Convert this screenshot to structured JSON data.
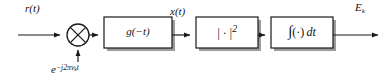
{
  "diagram": {
    "background_color": "#ffffff",
    "line_color": "#1a1a1a",
    "shadow_color": "#9a9a9a",
    "signals": {
      "input_label": "r(t)",
      "local_oscillator_label_base": "e",
      "local_oscillator_exponent": "−j2πν",
      "local_oscillator_exponent_subscript": "k",
      "local_oscillator_exponent_tail": "t",
      "intermediate_label": "x(t)",
      "output_label_base": "E",
      "output_label_subscript": "k"
    },
    "nodes": [
      {
        "name": "multiplier",
        "symbol": "⊗",
        "shape": "circle-with-cross",
        "cx": 78,
        "cy": 35,
        "r": 11
      }
    ],
    "blocks": [
      {
        "name": "matched-filter",
        "label": "g(−t)",
        "x": 104,
        "y": 17,
        "width": 68,
        "height": 31
      },
      {
        "name": "magnitude-squared",
        "label_base": "| · |",
        "label_exponent": "2",
        "x": 196,
        "y": 17,
        "width": 62,
        "height": 31
      },
      {
        "name": "integrator",
        "label_integral": "∫",
        "label_operand": "(·)",
        "label_differential": "dt",
        "x": 271,
        "y": 17,
        "width": 62,
        "height": 31
      }
    ],
    "connections": [
      {
        "name": "input-to-multiplier",
        "from": "input",
        "to": "multiplier"
      },
      {
        "name": "oscillator-to-multiplier",
        "from": "local-oscillator",
        "to": "multiplier"
      },
      {
        "name": "multiplier-to-matched-filter",
        "from": "multiplier",
        "to": "matched-filter"
      },
      {
        "name": "matched-filter-to-magnitude-squared",
        "from": "matched-filter",
        "to": "magnitude-squared"
      },
      {
        "name": "magnitude-squared-to-integrator",
        "from": "magnitude-squared",
        "to": "integrator"
      },
      {
        "name": "integrator-to-output",
        "from": "integrator",
        "to": "output"
      }
    ]
  }
}
